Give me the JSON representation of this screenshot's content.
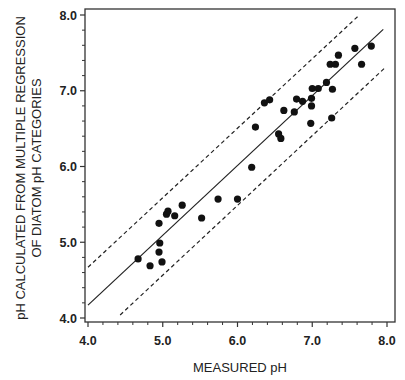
{
  "chart_data": {
    "type": "scatter",
    "title": "",
    "xlabel": "MEASURED pH",
    "ylabel_lines": [
      "pH CALCULATED FROM MULTIPLE REGRESSION",
      "OF DIATOM pH CATEGORIES"
    ],
    "xlim": [
      4.0,
      8.0
    ],
    "ylim": [
      4.0,
      8.0
    ],
    "x_ticks": [
      "4.0",
      "5.0",
      "6.0",
      "7.0",
      "8.0"
    ],
    "y_ticks": [
      "4.0",
      "5.0",
      "6.0",
      "7.0",
      "8.0"
    ],
    "minor_ticks_per_major": 5,
    "grid": false,
    "legend": null,
    "points": [
      [
        4.67,
        4.78
      ],
      [
        4.83,
        4.69
      ],
      [
        4.95,
        4.87
      ],
      [
        4.96,
        4.99
      ],
      [
        4.99,
        4.74
      ],
      [
        4.95,
        5.25
      ],
      [
        5.05,
        5.37
      ],
      [
        5.07,
        5.41
      ],
      [
        5.16,
        5.35
      ],
      [
        5.26,
        5.49
      ],
      [
        5.52,
        5.32
      ],
      [
        5.74,
        5.57
      ],
      [
        6.0,
        5.57
      ],
      [
        6.19,
        5.99
      ],
      [
        6.24,
        6.52
      ],
      [
        6.36,
        6.84
      ],
      [
        6.43,
        6.88
      ],
      [
        6.62,
        6.74
      ],
      [
        6.55,
        6.43
      ],
      [
        6.58,
        6.37
      ],
      [
        6.76,
        6.72
      ],
      [
        6.79,
        6.89
      ],
      [
        6.87,
        6.86
      ],
      [
        6.99,
        6.9
      ],
      [
        7.0,
        7.03
      ],
      [
        6.99,
        6.8
      ],
      [
        6.98,
        6.57
      ],
      [
        7.08,
        7.03
      ],
      [
        7.19,
        7.11
      ],
      [
        7.26,
        6.64
      ],
      [
        7.24,
        7.35
      ],
      [
        7.31,
        7.35
      ],
      [
        7.35,
        7.47
      ],
      [
        7.27,
        7.02
      ],
      [
        7.57,
        7.56
      ],
      [
        7.66,
        7.35
      ],
      [
        7.79,
        7.59
      ]
    ],
    "lines": [
      {
        "name": "regression line",
        "style": "solid",
        "from": [
          4.0,
          4.17
        ],
        "to": [
          7.95,
          7.81
        ]
      },
      {
        "name": "upper confidence bound",
        "style": "dashed",
        "from": [
          4.0,
          4.67
        ],
        "to": [
          7.63,
          8.0
        ]
      },
      {
        "name": "lower confidence bound",
        "style": "dashed",
        "from": [
          4.43,
          4.04
        ],
        "to": [
          7.98,
          7.31
        ]
      }
    ]
  }
}
